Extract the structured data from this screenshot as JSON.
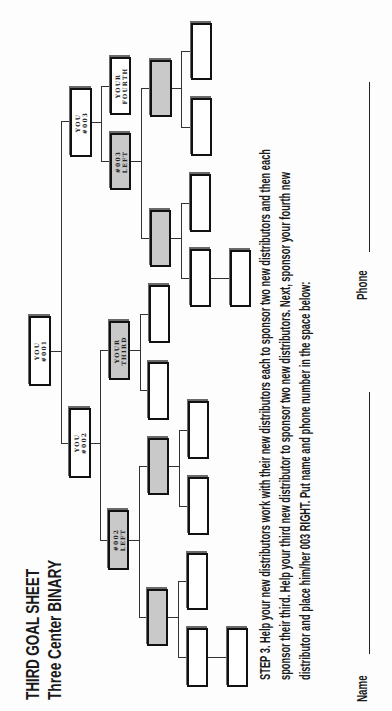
{
  "document": {
    "orientation": "rotated-90-ccw",
    "title": "THIRD GOAL SHEET",
    "subtitle": "Three Center BINARY",
    "instructions": {
      "line1": "STEP 3. Help your new distributors work with their new distributors each to sponsor two new distributors and then each",
      "line2": "sponsor their third. Help your third new distributor to sponsor two new distributors. Next,  sponsor your fourth new",
      "line3": "distributor and place him/her 003 RIGHT. Put name and phone number in the space below:"
    },
    "form": {
      "name_label": "Name",
      "name_value": "",
      "phone_label": "Phone",
      "phone_value": ""
    }
  },
  "tree": {
    "root": {
      "line1": "YOU",
      "line2": "#001",
      "fill": "white"
    },
    "level1": [
      {
        "id": "you-002",
        "line1": "YOU",
        "line2": "#002",
        "fill": "white"
      },
      {
        "id": "you-003",
        "line1": "YOU",
        "line2": "#003",
        "fill": "white"
      }
    ],
    "level2": [
      {
        "id": "002-left",
        "line1": "#002",
        "line2": "LEFT",
        "fill": "gray"
      },
      {
        "id": "your-third",
        "line1": "YOUR",
        "line2": "THIRD",
        "fill": "gray"
      },
      {
        "id": "003-left",
        "line1": "#003",
        "line2": "LEFT",
        "fill": "gray"
      },
      {
        "id": "your-fourth",
        "line1": "YOUR",
        "line2": "FOURTH",
        "fill": "white"
      }
    ],
    "colors": {
      "box_border": "#111111",
      "box_white": "#ffffff",
      "box_gray": "#c9c9c9",
      "connector": "#333333"
    }
  }
}
